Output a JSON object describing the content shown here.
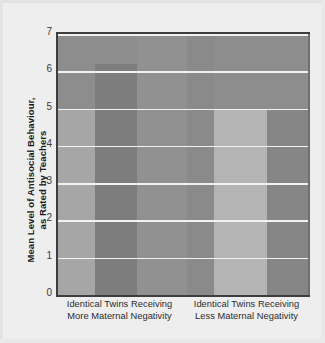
{
  "chart_data": {
    "type": "bar",
    "title": "",
    "subtitle": "",
    "xlabel": "",
    "ylabel": "Mean Level of Antisocial Behaviour,\nas Rated by Teachers",
    "ylim": [
      0,
      7
    ],
    "ytick_labels": [
      "7",
      "6",
      "5",
      "4",
      "3",
      "2",
      "1",
      "0"
    ],
    "ytick_values": [
      7,
      6,
      5,
      4,
      3,
      2,
      1,
      0
    ],
    "grid": true,
    "legend": "none",
    "categories": [
      "Identical Twins Receiving\nMore Maternal Negativity",
      "Identical Twins Receiving\nLess Maternal Negativity"
    ],
    "values": [
      6.2,
      5.0
    ],
    "series": [
      {
        "name": "Mean Level of Antisocial Behaviour",
        "values": [
          6.2,
          5.0
        ]
      }
    ],
    "bands": [
      {
        "name": "left-background-band",
        "value": 5.0,
        "fill": "#a6a6a6",
        "x": 0,
        "width": 37
      },
      {
        "name": "bar-more-negativity",
        "value": 6.2,
        "fill": "#7d7d7d",
        "x": 37,
        "width": 42
      },
      {
        "name": "mid-background-band",
        "value": 7.0,
        "fill": "#919191",
        "x": 79,
        "width": 50
      },
      {
        "name": "inner-background-band",
        "value": 7.0,
        "fill": "#8a8a8a",
        "x": 129,
        "width": 27
      },
      {
        "name": "bar-less-negativity",
        "value": 5.0,
        "fill": "#b4b4b4",
        "x": 156,
        "width": 53
      },
      {
        "name": "right-background-band",
        "value": 5.0,
        "fill": "#868686",
        "x": 209,
        "width": 43
      }
    ],
    "colors": {
      "plot_background": "#8d8d8d",
      "gridline": "#f2f2f2",
      "axis": "#3d3d3d",
      "page_background": "#eeeeee",
      "text": "#1a1a1a"
    }
  }
}
